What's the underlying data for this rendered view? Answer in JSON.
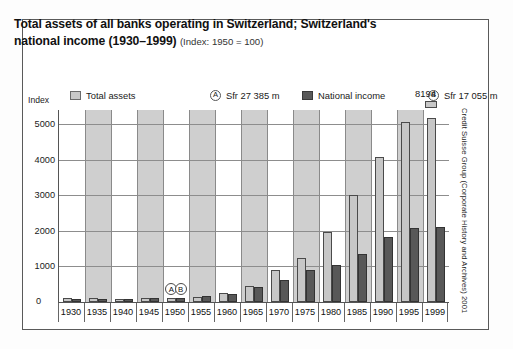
{
  "figure": {
    "title_line1": "Total assets of all banks operating in Switzerland; Switzerland's",
    "title_line2": "national income (1930–1999)",
    "title_sub": "(Index: 1950 = 100)",
    "source": "Credit Suisse Group (Corporate History and Archives) 2001",
    "axis_label": "Index",
    "zero_label": "0",
    "peak_label": "8194"
  },
  "legend": {
    "total_assets": "Total assets",
    "marker_a": "A",
    "note_a": "Sfr 27 385 m",
    "national_income": "National income",
    "marker_b": "B",
    "note_b": "Sfr 17 055 m"
  },
  "colors": {
    "total_assets_fill": "#c7c7c7",
    "total_assets_stroke": "#4a4a4a",
    "national_income_fill": "#585858",
    "national_income_stroke": "#333333",
    "band": "#cfcfcf",
    "grid": "#8d8d8d",
    "frame": "#5a5a5a"
  },
  "chart_data": {
    "type": "bar",
    "title": "Total assets of all banks operating in Switzerland; Switzerland's national income (1930–1999) (Index: 1950 = 100)",
    "xlabel": "",
    "ylabel": "Index",
    "ylim": [
      0,
      5400
    ],
    "yticks": [
      0,
      1000,
      2000,
      3000,
      4000,
      5000
    ],
    "ytick_labels": [
      "0",
      "1000",
      "2000",
      "3000",
      "4000",
      "5000"
    ],
    "grid": true,
    "legend_position": "top",
    "categories": [
      "1930",
      "1935",
      "1940",
      "1945",
      "1950",
      "1955",
      "1960",
      "1965",
      "1970",
      "1975",
      "1980",
      "1985",
      "1990",
      "1995",
      "1999"
    ],
    "series": [
      {
        "name": "Total assets",
        "values": [
          110,
          105,
          95,
          115,
          100,
          155,
          245,
          450,
          910,
          1240,
          1970,
          3020,
          4090,
          5050,
          8194
        ]
      },
      {
        "name": "National income",
        "values": [
          85,
          80,
          85,
          105,
          100,
          175,
          235,
          420,
          610,
          910,
          1050,
          1340,
          1830,
          2080,
          2110
        ]
      }
    ],
    "annotations": [
      {
        "label": "A",
        "category": "1950",
        "series": "Total assets",
        "note": "Sfr 27 385 m"
      },
      {
        "label": "B",
        "category": "1950",
        "series": "National income",
        "note": "Sfr 17 055 m"
      },
      {
        "label": "8194",
        "category": "1999",
        "series": "Total assets",
        "note": "bar truncated above axis maximum"
      }
    ],
    "shaded_category_indices": [
      1,
      3,
      5,
      7,
      9,
      11,
      13
    ]
  }
}
